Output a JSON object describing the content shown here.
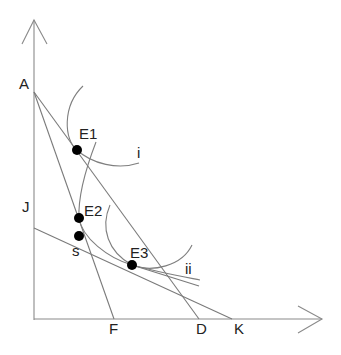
{
  "diagram": {
    "labels": {
      "A": "A",
      "J": "J",
      "F": "F",
      "D": "D",
      "K": "K",
      "E1": "E1",
      "E2": "E2",
      "E3": "E3",
      "s": "s",
      "i": "i",
      "ii": "ii"
    },
    "budget_lines": [
      {
        "name": "A-D",
        "from": "A",
        "to": "D"
      },
      {
        "name": "A-F",
        "from": "A",
        "to": "F"
      },
      {
        "name": "J-K",
        "from": "J",
        "to": "K"
      }
    ],
    "indifference_curves": [
      "i",
      "ii"
    ],
    "points": [
      "E1",
      "E2",
      "s",
      "E3"
    ],
    "colors": {
      "lines": "#7a7a7a",
      "points": "#000000",
      "text": "#222222"
    }
  }
}
